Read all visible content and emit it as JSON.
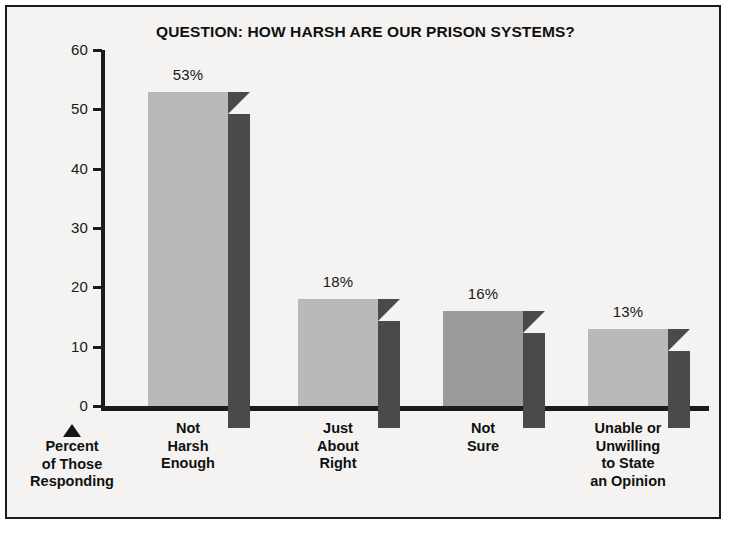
{
  "chart_data": {
    "type": "bar",
    "title": "QUESTION: HOW HARSH ARE OUR PRISON SYSTEMS?",
    "xlabel": "",
    "ylabel": "Percent\nof Those\nResponding",
    "ylim": [
      0,
      60
    ],
    "yticks": [
      0,
      10,
      20,
      30,
      40,
      50,
      60
    ],
    "ytick_labels": [
      "0",
      "10",
      "20",
      "30",
      "40",
      "50",
      "60"
    ],
    "grid": false,
    "legend": "none",
    "categories": [
      "Not\nHarsh\nEnough",
      "Just\nAbout\nRight",
      "Not\nSure",
      "Unable or\nUnwilling\nto State\nan Opinion"
    ],
    "values": [
      53,
      18,
      16,
      13
    ],
    "value_labels": [
      "53%",
      "18%",
      "16%",
      "13%"
    ],
    "colors": {
      "bar_front": "#b9b9b7",
      "bar_front_alt": "#9b9b99",
      "bar_side": "#4a4a4a",
      "axis": "#1c1c1c",
      "text": "#101010",
      "background": "#f4f3f1",
      "frame": "#1a1a1a"
    }
  },
  "figure": {
    "title": "QUESTION: HOW HARSH ARE OUR PRISON SYSTEMS?",
    "y_axis": {
      "caption": "Percent\nof Those\nResponding",
      "caption_marker": "up-triangle",
      "ticks": [
        {
          "label": "60",
          "value": 60
        },
        {
          "label": "50",
          "value": 50
        },
        {
          "label": "40",
          "value": 40
        },
        {
          "label": "30",
          "value": 30
        },
        {
          "label": "20",
          "value": 20
        },
        {
          "label": "10",
          "value": 10
        },
        {
          "label": "0",
          "value": 0
        }
      ]
    },
    "bars": [
      {
        "label": "Not\nHarsh\nEnough",
        "value": 53,
        "value_label": "53%",
        "shade": "light"
      },
      {
        "label": "Just\nAbout\nRight",
        "value": 18,
        "value_label": "18%",
        "shade": "light"
      },
      {
        "label": "Not\nSure",
        "value": 16,
        "value_label": "16%",
        "shade": "dark"
      },
      {
        "label": "Unable or\nUnwilling\nto State\nan Opinion",
        "value": 13,
        "value_label": "13%",
        "shade": "light"
      }
    ]
  }
}
